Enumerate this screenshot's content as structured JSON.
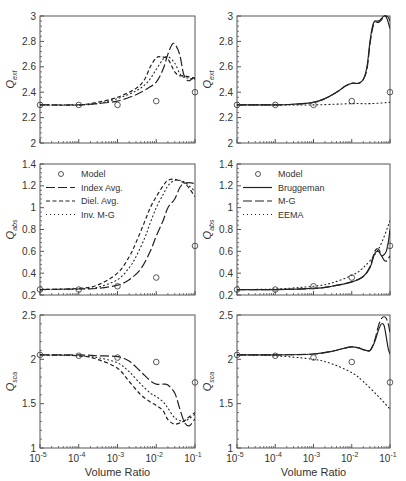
{
  "chart_data": [
    {
      "id": "ext-left",
      "type": "line",
      "title": "",
      "xlabel": "",
      "ylabel": "Q_ext",
      "ylabel_main": "Q",
      "ylabel_sub": "ext",
      "xscale": "log",
      "xlim": [
        1e-05,
        0.1
      ],
      "ylim": [
        2,
        3
      ],
      "yticks": [
        2,
        2.2,
        2.4,
        2.6,
        2.8,
        3
      ],
      "ytick_labels": [
        "2",
        "2.2",
        "2.4",
        "2.6",
        "2.8",
        "3"
      ],
      "legend": false,
      "series": [
        {
          "name": "Model",
          "style": "marker",
          "x": [
            1e-05,
            0.0001,
            0.001,
            0.01,
            0.1
          ],
          "y": [
            2.3,
            2.3,
            2.3,
            2.33,
            2.4
          ]
        },
        {
          "name": "Index Avg.",
          "style": "longdash",
          "x": [
            1e-05,
            0.0001,
            0.0003,
            0.001,
            0.003,
            0.006,
            0.01,
            0.015,
            0.02,
            0.025,
            0.03,
            0.04,
            0.05,
            0.06,
            0.07,
            0.08,
            0.09,
            0.1
          ],
          "y": [
            2.3,
            2.3,
            2.31,
            2.33,
            2.38,
            2.43,
            2.48,
            2.58,
            2.7,
            2.77,
            2.78,
            2.7,
            2.55,
            2.5,
            2.49,
            2.5,
            2.51,
            2.51
          ]
        },
        {
          "name": "Diel. Avg.",
          "style": "dash",
          "x": [
            1e-05,
            0.0001,
            0.0003,
            0.001,
            0.003,
            0.005,
            0.007,
            0.01,
            0.013,
            0.02,
            0.03,
            0.04,
            0.05,
            0.07,
            0.1
          ],
          "y": [
            2.3,
            2.3,
            2.32,
            2.36,
            2.43,
            2.5,
            2.6,
            2.67,
            2.68,
            2.66,
            2.56,
            2.53,
            2.53,
            2.52,
            2.51
          ]
        },
        {
          "name": "Inv. M-G",
          "style": "dot",
          "x": [
            1e-05,
            0.0001,
            0.0003,
            0.001,
            0.003,
            0.006,
            0.01,
            0.015,
            0.02,
            0.03,
            0.04,
            0.05,
            0.07,
            0.1
          ],
          "y": [
            2.3,
            2.3,
            2.31,
            2.35,
            2.41,
            2.48,
            2.58,
            2.66,
            2.68,
            2.63,
            2.55,
            2.52,
            2.51,
            2.5
          ]
        }
      ]
    },
    {
      "id": "ext-right",
      "type": "line",
      "title": "",
      "xlabel": "",
      "ylabel": "Q_ext",
      "ylabel_main": "Q",
      "ylabel_sub": "ext",
      "xscale": "log",
      "xlim": [
        1e-05,
        0.1
      ],
      "ylim": [
        2,
        3
      ],
      "yticks": [
        2,
        2.2,
        2.4,
        2.6,
        2.8,
        3
      ],
      "ytick_labels": [
        "2",
        "2.2",
        "2.4",
        "2.6",
        "2.8",
        "3"
      ],
      "legend": false,
      "series": [
        {
          "name": "Model",
          "style": "marker",
          "x": [
            1e-05,
            0.0001,
            0.001,
            0.01,
            0.1
          ],
          "y": [
            2.3,
            2.3,
            2.3,
            2.33,
            2.4
          ]
        },
        {
          "name": "Bruggeman",
          "style": "solid",
          "x": [
            1e-05,
            0.0001,
            0.0003,
            0.001,
            0.002,
            0.004,
            0.007,
            0.01,
            0.015,
            0.02,
            0.025,
            0.03,
            0.035,
            0.04,
            0.05,
            0.06,
            0.07,
            0.08,
            0.09,
            0.1
          ],
          "y": [
            2.3,
            2.3,
            2.305,
            2.32,
            2.35,
            2.4,
            2.45,
            2.47,
            2.47,
            2.5,
            2.6,
            2.8,
            2.92,
            2.96,
            2.96,
            2.98,
            3.0,
            2.99,
            2.95,
            2.9
          ]
        },
        {
          "name": "M-G",
          "style": "longdash",
          "x": [
            1e-05,
            0.0001,
            0.0003,
            0.001,
            0.002,
            0.004,
            0.007,
            0.01,
            0.015,
            0.02,
            0.025,
            0.03,
            0.035,
            0.04,
            0.05,
            0.06,
            0.07,
            0.08,
            0.09,
            0.1
          ],
          "y": [
            2.3,
            2.3,
            2.305,
            2.32,
            2.35,
            2.4,
            2.45,
            2.47,
            2.47,
            2.5,
            2.58,
            2.78,
            2.9,
            2.95,
            2.95,
            2.97,
            3.0,
            3.0,
            2.99,
            2.96
          ]
        },
        {
          "name": "EEMA",
          "style": "dot",
          "x": [
            1e-05,
            0.0001,
            0.001,
            0.01,
            0.03,
            0.1
          ],
          "y": [
            2.3,
            2.3,
            2.3,
            2.31,
            2.31,
            2.32
          ]
        }
      ]
    },
    {
      "id": "abs-left",
      "type": "line",
      "title": "",
      "xlabel": "",
      "ylabel": "Q_abs",
      "ylabel_main": "Q",
      "ylabel_sub": "abs",
      "xscale": "log",
      "xlim": [
        1e-05,
        0.1
      ],
      "ylim": [
        0.2,
        1.4
      ],
      "yticks": [
        0.2,
        0.4,
        0.6,
        0.8,
        1.0,
        1.2,
        1.4
      ],
      "ytick_labels": [
        "0.2",
        "0.4",
        "0.6",
        "0.8",
        "1",
        "1.2",
        "1.4"
      ],
      "legend": true,
      "legend_position": "upper left",
      "series": [
        {
          "name": "Model",
          "style": "marker",
          "x": [
            1e-05,
            0.0001,
            0.001,
            0.01,
            0.1
          ],
          "y": [
            0.25,
            0.25,
            0.28,
            0.36,
            0.65
          ]
        },
        {
          "name": "Index Avg.",
          "style": "longdash",
          "x": [
            1e-05,
            0.0001,
            0.0003,
            0.001,
            0.002,
            0.004,
            0.007,
            0.01,
            0.015,
            0.02,
            0.03,
            0.04,
            0.05,
            0.07,
            0.1
          ],
          "y": [
            0.25,
            0.255,
            0.26,
            0.29,
            0.34,
            0.44,
            0.6,
            0.74,
            0.88,
            1.0,
            1.08,
            1.18,
            1.22,
            1.23,
            1.22
          ]
        },
        {
          "name": "Diel. Avg.",
          "style": "dash",
          "x": [
            1e-05,
            0.0001,
            0.0003,
            0.001,
            0.002,
            0.003,
            0.005,
            0.007,
            0.01,
            0.015,
            0.02,
            0.03,
            0.05,
            0.07,
            0.1
          ],
          "y": [
            0.25,
            0.26,
            0.29,
            0.4,
            0.55,
            0.68,
            0.87,
            1.0,
            1.1,
            1.2,
            1.25,
            1.26,
            1.23,
            1.18,
            1.1
          ]
        },
        {
          "name": "Inv. M-G",
          "style": "dot",
          "x": [
            1e-05,
            0.0001,
            0.0003,
            0.001,
            0.002,
            0.003,
            0.005,
            0.007,
            0.01,
            0.015,
            0.02,
            0.03,
            0.05,
            0.07,
            0.1
          ],
          "y": [
            0.25,
            0.255,
            0.27,
            0.34,
            0.45,
            0.55,
            0.72,
            0.86,
            1.0,
            1.12,
            1.2,
            1.25,
            1.24,
            1.2,
            1.15
          ]
        }
      ]
    },
    {
      "id": "abs-right",
      "type": "line",
      "title": "",
      "xlabel": "",
      "ylabel": "Q_abs",
      "ylabel_main": "Q",
      "ylabel_sub": "abs",
      "xscale": "log",
      "xlim": [
        1e-05,
        0.1
      ],
      "ylim": [
        0.2,
        1.4
      ],
      "yticks": [
        0.2,
        0.4,
        0.6,
        0.8,
        1.0,
        1.2,
        1.4
      ],
      "ytick_labels": [
        "0.2",
        "0.4",
        "0.6",
        "0.8",
        "1",
        "1.2",
        "1.4"
      ],
      "legend": true,
      "legend_position": "upper left",
      "series": [
        {
          "name": "Model",
          "style": "marker",
          "x": [
            1e-05,
            0.0001,
            0.001,
            0.01,
            0.1
          ],
          "y": [
            0.25,
            0.25,
            0.28,
            0.36,
            0.65
          ]
        },
        {
          "name": "Bruggeman",
          "style": "solid",
          "x": [
            1e-05,
            0.0001,
            0.001,
            0.003,
            0.01,
            0.02,
            0.03,
            0.04,
            0.05,
            0.06,
            0.07,
            0.08,
            0.09,
            0.1
          ],
          "y": [
            0.25,
            0.25,
            0.26,
            0.28,
            0.32,
            0.37,
            0.45,
            0.58,
            0.6,
            0.56,
            0.57,
            0.6,
            0.68,
            0.8
          ]
        },
        {
          "name": "M-G",
          "style": "longdash",
          "x": [
            1e-05,
            0.0001,
            0.001,
            0.003,
            0.01,
            0.02,
            0.03,
            0.04,
            0.05,
            0.06,
            0.07,
            0.08,
            0.09,
            0.1
          ],
          "y": [
            0.25,
            0.25,
            0.26,
            0.28,
            0.32,
            0.37,
            0.46,
            0.6,
            0.62,
            0.56,
            0.52,
            0.51,
            0.53,
            0.56
          ]
        },
        {
          "name": "EEMA",
          "style": "dot",
          "x": [
            1e-05,
            0.0001,
            0.001,
            0.003,
            0.01,
            0.02,
            0.05,
            0.1
          ],
          "y": [
            0.25,
            0.255,
            0.28,
            0.31,
            0.38,
            0.45,
            0.62,
            0.88
          ]
        }
      ]
    },
    {
      "id": "sca-left",
      "type": "line",
      "title": "",
      "xlabel": "Volume Ratio",
      "ylabel": "Q_sca",
      "ylabel_main": "Q",
      "ylabel_sub": "sca",
      "xscale": "log",
      "xlim": [
        1e-05,
        0.1
      ],
      "xticks": [
        1e-05,
        0.0001,
        0.001,
        0.01,
        0.1
      ],
      "xtick_exponents": [
        "-5",
        "-4",
        "-3",
        "-2",
        "-1"
      ],
      "ylim": [
        1,
        2.5
      ],
      "yticks": [
        1,
        1.5,
        2,
        2.5
      ],
      "ytick_labels": [
        "1",
        "1.5",
        "2",
        "2.5"
      ],
      "legend": false,
      "series": [
        {
          "name": "Model",
          "style": "marker",
          "x": [
            1e-05,
            0.0001,
            0.001,
            0.01,
            0.1
          ],
          "y": [
            2.05,
            2.04,
            2.02,
            1.97,
            1.74
          ]
        },
        {
          "name": "Index Avg.",
          "style": "longdash",
          "x": [
            1e-05,
            0.0001,
            0.0003,
            0.001,
            0.002,
            0.004,
            0.007,
            0.01,
            0.015,
            0.02,
            0.03,
            0.04,
            0.05,
            0.06,
            0.07,
            0.08,
            0.09,
            0.1
          ],
          "y": [
            2.05,
            2.05,
            2.04,
            2.03,
            1.98,
            1.86,
            1.76,
            1.72,
            1.72,
            1.71,
            1.62,
            1.45,
            1.32,
            1.26,
            1.25,
            1.27,
            1.3,
            1.33
          ]
        },
        {
          "name": "Diel. Avg.",
          "style": "dash",
          "x": [
            1e-05,
            0.0001,
            0.0003,
            0.001,
            0.002,
            0.004,
            0.007,
            0.01,
            0.015,
            0.02,
            0.03,
            0.05,
            0.07,
            0.1
          ],
          "y": [
            2.05,
            2.04,
            2.0,
            1.9,
            1.75,
            1.6,
            1.52,
            1.48,
            1.42,
            1.32,
            1.27,
            1.3,
            1.35,
            1.4
          ]
        },
        {
          "name": "Inv. M-G",
          "style": "dot",
          "x": [
            1e-05,
            0.0001,
            0.0003,
            0.001,
            0.002,
            0.004,
            0.007,
            0.01,
            0.015,
            0.02,
            0.03,
            0.05,
            0.07,
            0.1
          ],
          "y": [
            2.05,
            2.04,
            2.02,
            1.96,
            1.86,
            1.72,
            1.62,
            1.58,
            1.52,
            1.45,
            1.34,
            1.3,
            1.33,
            1.38
          ]
        }
      ]
    },
    {
      "id": "sca-right",
      "type": "line",
      "title": "",
      "xlabel": "Volume Ratio",
      "ylabel": "Q_sca",
      "ylabel_main": "Q",
      "ylabel_sub": "sca",
      "xscale": "log",
      "xlim": [
        1e-05,
        0.1
      ],
      "xticks": [
        1e-05,
        0.0001,
        0.001,
        0.01,
        0.1
      ],
      "xtick_exponents": [
        "-5",
        "-4",
        "-3",
        "-2",
        "-1"
      ],
      "ylim": [
        1,
        2.5
      ],
      "yticks": [
        1,
        1.5,
        2,
        2.5
      ],
      "ytick_labels": [
        "1",
        "1.5",
        "2",
        "2.5"
      ],
      "legend": false,
      "series": [
        {
          "name": "Model",
          "style": "marker",
          "x": [
            1e-05,
            0.0001,
            0.001,
            0.01,
            0.1
          ],
          "y": [
            2.05,
            2.04,
            2.02,
            1.97,
            1.74
          ]
        },
        {
          "name": "Bruggeman",
          "style": "solid",
          "x": [
            1e-05,
            0.0001,
            0.001,
            0.003,
            0.007,
            0.01,
            0.015,
            0.02,
            0.03,
            0.04,
            0.05,
            0.06,
            0.07,
            0.08,
            0.09,
            0.1
          ],
          "y": [
            2.05,
            2.05,
            2.06,
            2.09,
            2.13,
            2.14,
            2.13,
            2.11,
            2.1,
            2.2,
            2.33,
            2.4,
            2.38,
            2.25,
            2.12,
            2.06
          ]
        },
        {
          "name": "M-G",
          "style": "longdash",
          "x": [
            1e-05,
            0.0001,
            0.001,
            0.003,
            0.007,
            0.01,
            0.015,
            0.02,
            0.03,
            0.04,
            0.05,
            0.06,
            0.07,
            0.08,
            0.09,
            0.1
          ],
          "y": [
            2.05,
            2.05,
            2.06,
            2.09,
            2.13,
            2.14,
            2.13,
            2.11,
            2.1,
            2.22,
            2.38,
            2.46,
            2.48,
            2.46,
            2.4,
            2.3
          ]
        },
        {
          "name": "EEMA",
          "style": "dot",
          "x": [
            1e-05,
            0.0001,
            0.001,
            0.003,
            0.01,
            0.02,
            0.05,
            0.1
          ],
          "y": [
            2.05,
            2.04,
            2.0,
            1.95,
            1.85,
            1.75,
            1.58,
            1.44
          ]
        }
      ]
    }
  ],
  "legends": {
    "left": [
      "Model",
      "Index Avg.",
      "Diel. Avg.",
      "Inv. M-G"
    ],
    "right": [
      "Model",
      "Bruggeman",
      "M-G",
      "EEMA"
    ]
  },
  "axis": {
    "xlabel": "Volume Ratio",
    "xtick_base": "10"
  },
  "colors": {
    "line": "#222222",
    "frame": "#555555",
    "text": "#333333",
    "marker": "#444444"
  }
}
